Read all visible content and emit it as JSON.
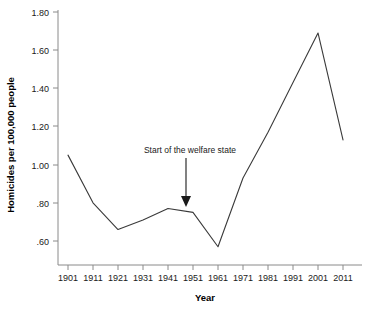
{
  "chart_data": {
    "type": "line",
    "title": "",
    "xlabel": "Year",
    "ylabel": "Homicides per 100,000 people",
    "categories": [
      "1901",
      "1911",
      "1921",
      "1931",
      "1941",
      "1951",
      "1961",
      "1971",
      "1981",
      "1991",
      "2001",
      "2011"
    ],
    "x": [
      1901,
      1911,
      1921,
      1931,
      1941,
      1951,
      1961,
      1971,
      1981,
      1991,
      2001,
      2011
    ],
    "values": [
      1.05,
      0.8,
      0.66,
      0.71,
      0.77,
      0.75,
      0.57,
      0.93,
      1.17,
      1.43,
      1.69,
      1.13
    ],
    "series": [
      {
        "name": "Homicides per 100,000 people",
        "values": [
          1.05,
          0.8,
          0.66,
          0.71,
          0.77,
          0.75,
          0.57,
          0.93,
          1.17,
          1.43,
          1.69,
          1.13
        ]
      }
    ],
    "ytick_labels": [
      "1.80",
      "1.60",
      "1.40",
      "1.20",
      "1.00",
      ".80",
      ".60"
    ],
    "ytick_values": [
      1.8,
      1.6,
      1.4,
      1.2,
      1.0,
      0.8,
      0.6
    ],
    "xtick_labels": [
      "1901",
      "1911",
      "1921",
      "1931",
      "1941",
      "1951",
      "1961",
      "1971",
      "1981",
      "1991",
      "2001",
      "2011"
    ],
    "ylim": [
      0.5,
      1.8
    ],
    "xlim": [
      1901,
      2011
    ],
    "grid": false,
    "legend": "none",
    "line_color": "#3a3a3a",
    "axis_color": "#8a8a8a",
    "annotations": [
      {
        "text": "Start of the welfare state",
        "arrow": "down",
        "points_to_year": 1947,
        "points_to_value": 0.76
      }
    ]
  },
  "axes": {
    "y_title": "Homicides per 100,000 people",
    "x_title": "Year"
  },
  "annotation": {
    "label": "Start of the welfare state"
  }
}
